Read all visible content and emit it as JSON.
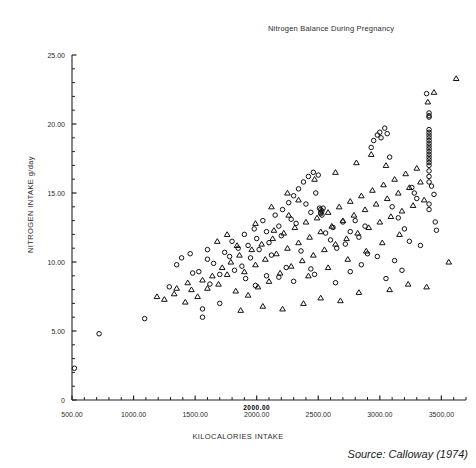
{
  "chart_data": {
    "type": "scatter",
    "title": "Nitrogen Balance During Pregnancy",
    "xlabel": "KILOCALORIES INTAKE",
    "ylabel": "NITROGEN INTAKE g/day",
    "source": "Source: Calloway (1974)",
    "xlim": [
      500,
      3700
    ],
    "ylim": [
      0,
      25
    ],
    "xticks": [
      500,
      1000,
      1500,
      2000,
      2500,
      3000,
      3500
    ],
    "xticklabels": [
      "500.00",
      "1000.00",
      "1500.00",
      "2000.00",
      "2500.00",
      "3000.00",
      "3500.00"
    ],
    "x_minor_tick_step": 100,
    "yticks": [
      0,
      5,
      10,
      15,
      20,
      25
    ],
    "yticklabels": [
      "0",
      "5.00",
      "10.00",
      "15.00",
      "20.00",
      "25.00"
    ],
    "y_minor_tick_step": 1,
    "grid": false,
    "legend": "none",
    "overlap_artifact_label": "2000.00",
    "marker_size_px": 4.5,
    "series": [
      {
        "name": "circle-series",
        "marker": "circle",
        "points": [
          [
            520,
            2.3
          ],
          [
            720,
            4.8
          ],
          [
            1090,
            5.9
          ],
          [
            1560,
            6.0
          ],
          [
            1560,
            6.6
          ],
          [
            1620,
            8.4
          ],
          [
            1700,
            7.0
          ],
          [
            1480,
            9.2
          ],
          [
            1530,
            9.3
          ],
          [
            1600,
            10.2
          ],
          [
            1650,
            9.9
          ],
          [
            1740,
            10.7
          ],
          [
            1780,
            10.4
          ],
          [
            1800,
            11.5
          ],
          [
            1850,
            11.0
          ],
          [
            1880,
            9.7
          ],
          [
            1900,
            12.0
          ],
          [
            1930,
            11.2
          ],
          [
            1950,
            10.3
          ],
          [
            1980,
            12.4
          ],
          [
            2000,
            11.7
          ],
          [
            2020,
            10.9
          ],
          [
            2050,
            13.0
          ],
          [
            2080,
            12.2
          ],
          [
            2100,
            11.4
          ],
          [
            2120,
            10.5
          ],
          [
            2150,
            13.4
          ],
          [
            2180,
            12.6
          ],
          [
            2200,
            11.9
          ],
          [
            2210,
            13.8
          ],
          [
            2240,
            9.6
          ],
          [
            2260,
            14.3
          ],
          [
            2280,
            13.1
          ],
          [
            2300,
            14.8
          ],
          [
            2320,
            12.8
          ],
          [
            2340,
            15.3
          ],
          [
            2360,
            10.8
          ],
          [
            2380,
            15.8
          ],
          [
            2400,
            14.2
          ],
          [
            2420,
            16.2
          ],
          [
            2440,
            13.6
          ],
          [
            2460,
            16.5
          ],
          [
            2480,
            15.0
          ],
          [
            2500,
            16.3
          ],
          [
            2510,
            13.9
          ],
          [
            2520,
            13.8
          ],
          [
            2520,
            13.6
          ],
          [
            2520,
            13.5
          ],
          [
            2530,
            13.7
          ],
          [
            2530,
            13.4
          ],
          [
            2540,
            13.9
          ],
          [
            2560,
            12.1
          ],
          [
            2600,
            11.6
          ],
          [
            2620,
            12.5
          ],
          [
            2650,
            11.0
          ],
          [
            2700,
            12.9
          ],
          [
            2720,
            11.3
          ],
          [
            2760,
            12.2
          ],
          [
            2800,
            13.0
          ],
          [
            2830,
            11.8
          ],
          [
            2880,
            12.6
          ],
          [
            2900,
            10.6
          ],
          [
            2930,
            18.3
          ],
          [
            2950,
            18.8
          ],
          [
            2980,
            19.2
          ],
          [
            3000,
            19.4
          ],
          [
            3010,
            19.0
          ],
          [
            3040,
            19.7
          ],
          [
            3060,
            19.3
          ],
          [
            3080,
            17.6
          ],
          [
            3100,
            14.0
          ],
          [
            3150,
            13.2
          ],
          [
            3200,
            12.4
          ],
          [
            3240,
            11.5
          ],
          [
            3260,
            15.4
          ],
          [
            3280,
            15.0
          ],
          [
            3300,
            14.6
          ],
          [
            3330,
            11.2
          ],
          [
            3380,
            22.2
          ],
          [
            3400,
            20.8
          ],
          [
            3400,
            20.6
          ],
          [
            3400,
            20.5
          ],
          [
            3400,
            19.6
          ],
          [
            3400,
            19.4
          ],
          [
            3400,
            19.2
          ],
          [
            3400,
            19.0
          ],
          [
            3400,
            18.8
          ],
          [
            3400,
            18.6
          ],
          [
            3400,
            18.4
          ],
          [
            3400,
            18.2
          ],
          [
            3400,
            18.0
          ],
          [
            3400,
            17.8
          ],
          [
            3400,
            17.6
          ],
          [
            3400,
            17.4
          ],
          [
            3400,
            17.2
          ],
          [
            3400,
            17.0
          ],
          [
            3400,
            16.6
          ],
          [
            3400,
            16.2
          ],
          [
            3400,
            15.8
          ],
          [
            3400,
            14.2
          ],
          [
            3400,
            13.8
          ],
          [
            3420,
            15.5
          ],
          [
            3440,
            14.9
          ],
          [
            3450,
            12.9
          ],
          [
            3460,
            12.3
          ],
          [
            2470,
            9.1
          ],
          [
            2440,
            9.5
          ],
          [
            2300,
            8.6
          ],
          [
            2180,
            8.9
          ],
          [
            2080,
            9.0
          ],
          [
            1990,
            8.3
          ],
          [
            1910,
            8.8
          ],
          [
            1820,
            9.4
          ],
          [
            1700,
            9.1
          ],
          [
            1600,
            10.9
          ],
          [
            1460,
            10.6
          ],
          [
            1390,
            10.3
          ],
          [
            1350,
            9.8
          ],
          [
            1290,
            8.2
          ],
          [
            2640,
            8.5
          ],
          [
            2760,
            9.3
          ],
          [
            2850,
            9.8
          ],
          [
            2980,
            10.4
          ],
          [
            3120,
            10.1
          ],
          [
            3180,
            9.4
          ],
          [
            3050,
            8.8
          ]
        ]
      },
      {
        "name": "triangle-series",
        "marker": "triangle",
        "points": [
          [
            1250,
            7.3
          ],
          [
            1330,
            7.7
          ],
          [
            1420,
            7.1
          ],
          [
            1470,
            8.0
          ],
          [
            1520,
            7.5
          ],
          [
            1560,
            8.7
          ],
          [
            1600,
            8.1
          ],
          [
            1640,
            9.0
          ],
          [
            1690,
            8.4
          ],
          [
            1720,
            9.6
          ],
          [
            1760,
            9.1
          ],
          [
            1790,
            10.0
          ],
          [
            1830,
            7.9
          ],
          [
            1860,
            10.5
          ],
          [
            1900,
            9.3
          ],
          [
            1930,
            7.6
          ],
          [
            1960,
            10.9
          ],
          [
            1990,
            9.8
          ],
          [
            2010,
            8.2
          ],
          [
            2040,
            11.3
          ],
          [
            2070,
            10.2
          ],
          [
            2100,
            8.6
          ],
          [
            2130,
            11.7
          ],
          [
            2160,
            10.6
          ],
          [
            2190,
            9.2
          ],
          [
            2220,
            12.1
          ],
          [
            2250,
            11.0
          ],
          [
            2280,
            9.7
          ],
          [
            2310,
            12.5
          ],
          [
            2340,
            11.4
          ],
          [
            2370,
            10.1
          ],
          [
            2400,
            12.9
          ],
          [
            2430,
            11.8
          ],
          [
            2460,
            10.5
          ],
          [
            2490,
            13.2
          ],
          [
            2520,
            12.2
          ],
          [
            2550,
            10.9
          ],
          [
            2580,
            13.6
          ],
          [
            2610,
            12.6
          ],
          [
            2640,
            11.3
          ],
          [
            2670,
            14.0
          ],
          [
            2700,
            13.0
          ],
          [
            2730,
            11.7
          ],
          [
            2760,
            14.4
          ],
          [
            2790,
            13.4
          ],
          [
            2820,
            12.1
          ],
          [
            2850,
            14.8
          ],
          [
            2880,
            13.8
          ],
          [
            2910,
            12.5
          ],
          [
            2940,
            15.2
          ],
          [
            2970,
            14.2
          ],
          [
            3000,
            12.9
          ],
          [
            3030,
            15.6
          ],
          [
            3060,
            14.6
          ],
          [
            3090,
            13.3
          ],
          [
            3120,
            16.0
          ],
          [
            3150,
            15.0
          ],
          [
            3180,
            13.7
          ],
          [
            3210,
            16.4
          ],
          [
            3240,
            15.4
          ],
          [
            3270,
            14.1
          ],
          [
            3300,
            16.8
          ],
          [
            3330,
            15.8
          ],
          [
            3360,
            14.5
          ],
          [
            3390,
            21.6
          ],
          [
            3440,
            22.3
          ],
          [
            3620,
            23.3
          ],
          [
            1870,
            6.5
          ],
          [
            2050,
            6.8
          ],
          [
            2210,
            6.6
          ],
          [
            2380,
            7.0
          ],
          [
            2520,
            7.4
          ],
          [
            2680,
            7.2
          ],
          [
            2830,
            7.8
          ],
          [
            3080,
            8.0
          ],
          [
            3230,
            8.4
          ],
          [
            3380,
            8.2
          ],
          [
            3560,
            10.0
          ],
          [
            1680,
            11.5
          ],
          [
            1760,
            12.0
          ],
          [
            1840,
            11.2
          ],
          [
            1990,
            12.8
          ],
          [
            2140,
            12.3
          ],
          [
            2260,
            13.4
          ],
          [
            2420,
            9.0
          ],
          [
            2580,
            9.6
          ],
          [
            2740,
            10.2
          ],
          [
            2890,
            10.8
          ],
          [
            3020,
            11.4
          ],
          [
            3160,
            12.0
          ],
          [
            2250,
            15.0
          ],
          [
            2120,
            14.0
          ],
          [
            2340,
            14.5
          ],
          [
            2470,
            16.0
          ],
          [
            2640,
            16.5
          ],
          [
            2810,
            17.2
          ],
          [
            2930,
            17.8
          ],
          [
            3050,
            17.0
          ],
          [
            1440,
            8.5
          ],
          [
            1350,
            8.1
          ],
          [
            1190,
            7.5
          ]
        ]
      }
    ]
  }
}
